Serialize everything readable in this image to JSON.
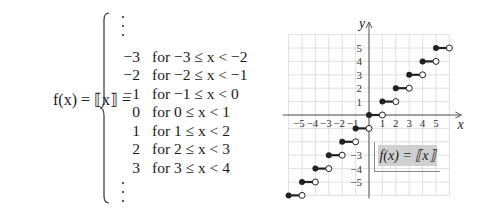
{
  "equation": {
    "lhs": "f(x) = ⟦x⟧ =",
    "rows": [
      {
        "value": "−3",
        "condition": "for −3 ≤ x < −2"
      },
      {
        "value": "−2",
        "condition": "for −2 ≤ x < −1"
      },
      {
        "value": "−1",
        "condition": "for −1 ≤ x < 0"
      },
      {
        "value": "0",
        "condition": "for 0 ≤ x < 1"
      },
      {
        "value": "1",
        "condition": "for 1 ≤ x < 2"
      },
      {
        "value": "2",
        "condition": "for 2 ≤ x < 3"
      },
      {
        "value": "3",
        "condition": "for 3 ≤ x < 4"
      }
    ],
    "ellipsis_top": "⋮",
    "ellipsis_bottom": "⋮"
  },
  "graph": {
    "label": "f(x) = ⟦x⟧",
    "x_axis_label": "x",
    "y_axis_label": "y",
    "x_tick_labels": [
      "−5",
      "−4",
      "−3",
      "−2",
      "−1",
      "1",
      "2",
      "3",
      "4",
      "5"
    ],
    "x_ticks": [
      -5,
      -4,
      -3,
      -2,
      -1,
      1,
      2,
      3,
      4,
      5
    ],
    "y_tick_labels": [
      "5",
      "4",
      "3",
      "2",
      "1",
      "−3",
      "−4",
      "−5"
    ],
    "y_ticks": [
      5,
      4,
      3,
      2,
      1,
      -3,
      -4,
      -5
    ],
    "colors": {
      "grid": "#d8d8d8",
      "axis": "#555555",
      "step": "#222222",
      "label_bg": "#d0d0d0"
    }
  },
  "chart_data": {
    "type": "line",
    "xlabel": "x",
    "ylabel": "y",
    "xlim": [
      -6,
      6
    ],
    "ylim": [
      -6,
      6
    ],
    "grid": true,
    "steps": [
      {
        "x_start": -6,
        "x_end": -5,
        "y": -6
      },
      {
        "x_start": -5,
        "x_end": -4,
        "y": -5
      },
      {
        "x_start": -4,
        "x_end": -3,
        "y": -4
      },
      {
        "x_start": -3,
        "x_end": -2,
        "y": -3
      },
      {
        "x_start": -2,
        "x_end": -1,
        "y": -2
      },
      {
        "x_start": -1,
        "x_end": 0,
        "y": -1
      },
      {
        "x_start": 0,
        "x_end": 1,
        "y": 0
      },
      {
        "x_start": 1,
        "x_end": 2,
        "y": 1
      },
      {
        "x_start": 2,
        "x_end": 3,
        "y": 2
      },
      {
        "x_start": 3,
        "x_end": 4,
        "y": 3
      },
      {
        "x_start": 4,
        "x_end": 5,
        "y": 4
      },
      {
        "x_start": 5,
        "x_end": 6,
        "y": 5
      }
    ],
    "endpoint_style": {
      "left": "closed",
      "right": "open"
    }
  }
}
